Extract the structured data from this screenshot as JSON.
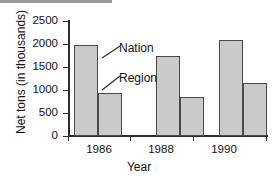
{
  "chart_data": {
    "type": "bar",
    "title": "",
    "xlabel": "Year",
    "ylabel": "Net tons (in thousands)",
    "categories": [
      "1986",
      "1988",
      "1990"
    ],
    "series": [
      {
        "name": "Nation",
        "values": [
          1970,
          1740,
          2090
        ]
      },
      {
        "name": "Region",
        "values": [
          940,
          850,
          1150
        ]
      }
    ],
    "ylim": [
      0,
      2500
    ],
    "yticks": [
      0,
      500,
      1000,
      1500,
      2000,
      2500
    ],
    "ytick_labels": [
      "0",
      "500",
      "1000",
      "1500",
      "2000",
      "2500"
    ],
    "grid": false,
    "legend": "annotations",
    "annotations": [
      {
        "text": "Nation",
        "points_to": "1986 first bar"
      },
      {
        "text": "Region",
        "points_to": "1986 second bar"
      }
    ],
    "bar_fill_color": "#cacaca",
    "bar_edge_color": "#4a4a4a",
    "axis_color": "#2b2b2b",
    "background_color": "#ffffff"
  },
  "axes": {
    "y_title": "Net tons (in thousands)",
    "x_title": "Year"
  },
  "yticks": [
    {
      "label": "2500"
    },
    {
      "label": "2000"
    },
    {
      "label": "1500"
    },
    {
      "label": "1000"
    },
    {
      "label": "500"
    },
    {
      "label": "0"
    }
  ],
  "xticks": [
    {
      "label": "1986"
    },
    {
      "label": "1988"
    },
    {
      "label": "1990"
    }
  ],
  "annotations": [
    {
      "label": "Nation"
    },
    {
      "label": "Region"
    }
  ]
}
